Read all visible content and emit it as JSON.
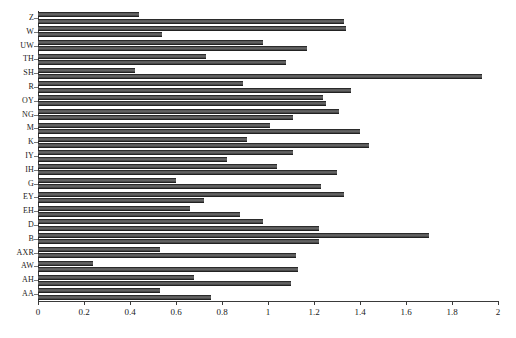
{
  "chart_data": {
    "type": "bar",
    "orientation": "horizontal",
    "title": "",
    "xlabel": "",
    "ylabel": "",
    "xlim": [
      0,
      2
    ],
    "ylim": null,
    "grid": false,
    "legend": null,
    "xticks": [
      "0",
      "0.2",
      "0.4",
      "0.6",
      "0.8",
      "1",
      "1.2",
      "1.4",
      "1.6",
      "1.8",
      "2"
    ],
    "xtick_values": [
      0,
      0.2,
      0.4,
      0.6,
      0.8,
      1,
      1.2,
      1.4,
      1.6,
      1.8,
      2
    ],
    "categories": [
      "Z",
      "W",
      "UW",
      "TH",
      "SH",
      "R",
      "OY",
      "NG",
      "M",
      "K",
      "IY",
      "IH",
      "G",
      "EY",
      "EH",
      "D",
      "B",
      "AXR",
      "AW",
      "AH",
      "AA"
    ],
    "series": [
      {
        "name": "series-1",
        "values": [
          0.44,
          1.34,
          0.98,
          0.73,
          0.42,
          0.89,
          1.24,
          1.31,
          1.01,
          0.91,
          1.11,
          1.04,
          0.6,
          1.33,
          0.66,
          0.98,
          1.7,
          0.53,
          0.24,
          0.68,
          0.53
        ]
      },
      {
        "name": "series-2",
        "values": [
          1.33,
          0.54,
          1.17,
          1.08,
          1.93,
          1.36,
          1.25,
          1.11,
          1.4,
          1.44,
          0.82,
          1.3,
          1.23,
          0.72,
          0.88,
          1.22,
          1.22,
          1.12,
          1.13,
          1.1,
          0.75
        ]
      }
    ],
    "colors": {
      "bar_fill": "#5a5a5a",
      "bar_edge": "#222222",
      "axis": "#3a3a3a",
      "background": "#ffffff"
    }
  }
}
